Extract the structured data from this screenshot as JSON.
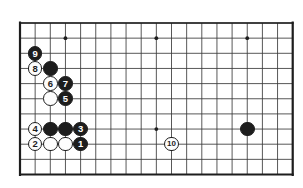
{
  "figure": {
    "kind": "go-board-diagram",
    "title": "",
    "board": {
      "columns": 19,
      "rows": 11,
      "visible_left_edge": true,
      "visible_right_edge": true,
      "visible_top_edge": true,
      "visible_bottom_edge": true,
      "line_color": "#3a3a3a",
      "border_color": "#1d1d1d",
      "background_color": "#ffffff",
      "origin_x": 20,
      "origin_y": 23,
      "spacing": 15.15,
      "star_points": [
        {
          "col": 3,
          "row": 1
        },
        {
          "col": 9,
          "row": 1
        },
        {
          "col": 15,
          "row": 1
        },
        {
          "col": 9,
          "row": 7
        }
      ]
    },
    "stones": [
      {
        "label": "9",
        "color": "black",
        "col": 1,
        "row": 2
      },
      {
        "label": "8",
        "color": "white",
        "col": 1,
        "row": 3
      },
      {
        "label": "",
        "color": "black",
        "col": 2,
        "row": 3
      },
      {
        "label": "6",
        "color": "white",
        "col": 2,
        "row": 4
      },
      {
        "label": "7",
        "color": "black",
        "col": 3,
        "row": 4
      },
      {
        "label": "",
        "color": "white",
        "col": 2,
        "row": 5
      },
      {
        "label": "5",
        "color": "black",
        "col": 3,
        "row": 5
      },
      {
        "label": "4",
        "color": "white",
        "col": 1,
        "row": 7
      },
      {
        "label": "",
        "color": "black",
        "col": 2,
        "row": 7
      },
      {
        "label": "",
        "color": "black",
        "col": 3,
        "row": 7
      },
      {
        "label": "3",
        "color": "black",
        "col": 4,
        "row": 7
      },
      {
        "label": "2",
        "color": "white",
        "col": 1,
        "row": 8
      },
      {
        "label": "",
        "color": "white",
        "col": 2,
        "row": 8
      },
      {
        "label": "",
        "color": "white",
        "col": 3,
        "row": 8
      },
      {
        "label": "1",
        "color": "black",
        "col": 4,
        "row": 8
      },
      {
        "label": "10",
        "color": "white",
        "col": 10,
        "row": 8
      },
      {
        "label": "",
        "color": "black",
        "col": 15,
        "row": 7
      }
    ],
    "colors": {
      "black_stone": "#1d1d1d",
      "white_stone": "#fdfdfd",
      "grid_line": "#3a3a3a",
      "board_border": "#1d1d1d",
      "page_background": "#ffffff"
    }
  }
}
